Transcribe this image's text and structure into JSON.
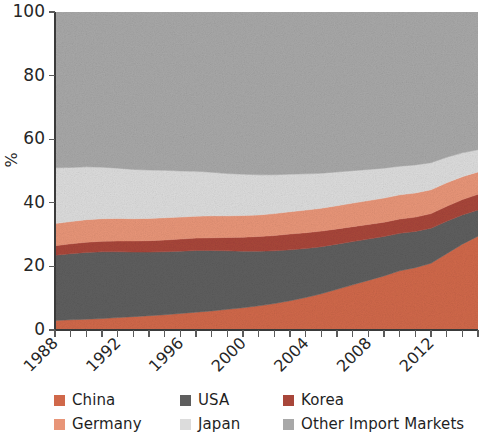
{
  "chart_data": {
    "type": "area",
    "stacked": true,
    "normalized_percent": true,
    "title": "",
    "subtitle": "",
    "xlabel": "",
    "ylabel": "%",
    "ylim": [
      0,
      100
    ],
    "yticks": [
      0,
      20,
      40,
      60,
      80,
      100
    ],
    "ytick_labels": [
      "0",
      "20",
      "40",
      "60",
      "80",
      "100"
    ],
    "xlim": [
      1988,
      2015
    ],
    "xticks": [
      1988,
      1989,
      1990,
      1991,
      1992,
      1993,
      1994,
      1995,
      1996,
      1997,
      1998,
      1999,
      2000,
      2001,
      2002,
      2003,
      2004,
      2005,
      2006,
      2007,
      2008,
      2009,
      2010,
      2011,
      2012,
      2013,
      2014,
      2015
    ],
    "xtick_labels": [
      "1988",
      "",
      "",
      "",
      "1992",
      "",
      "",
      "",
      "1996",
      "",
      "",
      "",
      "2000",
      "",
      "",
      "",
      "2004",
      "",
      "",
      "",
      "2008",
      "",
      "",
      "",
      "2012",
      "",
      "",
      ""
    ],
    "xtick_label_rotation": 45,
    "grid": false,
    "legend_position": "bottom",
    "legend_columns": 3,
    "x": [
      1988,
      1989,
      1990,
      1991,
      1992,
      1993,
      1994,
      1995,
      1996,
      1997,
      1998,
      1999,
      2000,
      2001,
      2002,
      2003,
      2004,
      2005,
      2006,
      2007,
      2008,
      2009,
      2010,
      2011,
      2012,
      2013,
      2014,
      2015
    ],
    "stack_order_bottom_to_top": [
      "China",
      "USA",
      "Korea",
      "Germany",
      "Japan",
      "Other Import Markets"
    ],
    "series": [
      {
        "name": "China",
        "color": "#d0684a",
        "values": [
          3.0,
          3.2,
          3.4,
          3.6,
          3.9,
          4.2,
          4.5,
          4.8,
          5.2,
          5.6,
          6.0,
          6.5,
          7.0,
          7.6,
          8.3,
          9.2,
          10.2,
          11.4,
          12.8,
          14.2,
          15.6,
          17.0,
          18.6,
          19.6,
          21.0,
          24.0,
          27.0,
          29.5
        ]
      },
      {
        "name": "USA",
        "color": "#5e5e5e",
        "values": [
          20.5,
          20.8,
          21.0,
          21.0,
          20.7,
          20.3,
          20.0,
          19.8,
          19.6,
          19.4,
          19.0,
          18.4,
          17.8,
          17.2,
          16.6,
          16.0,
          15.4,
          14.8,
          14.2,
          13.6,
          13.0,
          12.4,
          11.8,
          11.4,
          11.0,
          10.2,
          9.2,
          8.2
        ]
      },
      {
        "name": "Korea",
        "color": "#a8463a",
        "values": [
          3.0,
          3.1,
          3.2,
          3.3,
          3.4,
          3.5,
          3.6,
          3.7,
          3.8,
          3.9,
          4.0,
          4.2,
          4.4,
          4.6,
          4.8,
          5.0,
          5.0,
          4.9,
          4.8,
          4.7,
          4.6,
          4.5,
          4.5,
          4.5,
          4.6,
          4.7,
          4.8,
          5.0
        ]
      },
      {
        "name": "Germany",
        "color": "#e89578",
        "values": [
          7.0,
          7.0,
          7.1,
          7.1,
          7.1,
          7.0,
          7.0,
          7.0,
          6.9,
          6.9,
          6.9,
          6.8,
          6.8,
          6.8,
          6.9,
          7.0,
          7.1,
          7.2,
          7.3,
          7.4,
          7.5,
          7.6,
          7.6,
          7.6,
          7.5,
          7.4,
          7.2,
          7.0
        ]
      },
      {
        "name": "Japan",
        "color": "#dcdcdc",
        "values": [
          17.5,
          17.0,
          16.6,
          16.2,
          15.8,
          15.5,
          15.2,
          14.9,
          14.5,
          14.1,
          13.7,
          13.3,
          13.0,
          12.6,
          12.2,
          11.8,
          11.4,
          11.0,
          10.6,
          10.2,
          9.8,
          9.4,
          9.0,
          8.8,
          8.5,
          8.0,
          7.5,
          7.0
        ]
      },
      {
        "name": "Other Import Markets",
        "color": "#a8a8a8",
        "values": [
          49.0,
          48.9,
          48.7,
          48.8,
          49.1,
          49.5,
          49.7,
          49.8,
          50.0,
          50.1,
          50.4,
          50.8,
          51.0,
          51.2,
          51.2,
          51.0,
          50.9,
          50.7,
          50.3,
          49.9,
          49.5,
          49.1,
          48.5,
          48.1,
          47.4,
          45.7,
          44.3,
          43.3
        ]
      }
    ]
  },
  "legend": {
    "rows": [
      [
        {
          "label": "China",
          "color": "#d0684a"
        },
        {
          "label": "USA",
          "color": "#5e5e5e"
        },
        {
          "label": "Korea",
          "color": "#a8463a"
        }
      ],
      [
        {
          "label": "Germany",
          "color": "#e89578"
        },
        {
          "label": "Japan",
          "color": "#dcdcdc"
        },
        {
          "label": "Other Import Markets",
          "color": "#a8a8a8"
        }
      ]
    ]
  }
}
